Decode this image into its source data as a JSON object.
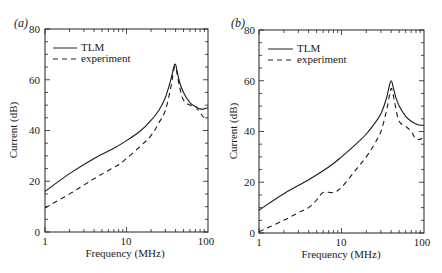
{
  "chart_data": [
    {
      "panel_label": "(a)",
      "type": "line",
      "xlabel": "Frequency (MHz)",
      "ylabel": "Current (dB)",
      "xscale": "log",
      "xlim": [
        1,
        100
      ],
      "ylim": [
        0,
        80
      ],
      "xticks": [
        "1",
        "10",
        "100"
      ],
      "yticks": [
        "0",
        "20",
        "40",
        "60",
        "80"
      ],
      "grid": false,
      "legend": {
        "position": "upper left",
        "entries": [
          "TLM",
          "experiment"
        ]
      },
      "series": [
        {
          "name": "TLM",
          "style": "solid",
          "x": [
            1,
            2,
            4,
            7,
            10,
            15,
            20,
            25,
            30,
            35,
            38,
            40,
            42,
            45,
            50,
            60,
            70,
            80,
            90,
            100
          ],
          "y": [
            16,
            23,
            29,
            33,
            36,
            40,
            44,
            48,
            53,
            60,
            65,
            66,
            63,
            59,
            55,
            51,
            49.5,
            48.5,
            48.5,
            49
          ]
        },
        {
          "name": "experiment",
          "style": "dashed",
          "x": [
            1,
            2,
            4,
            7,
            8,
            10,
            15,
            20,
            25,
            30,
            35,
            38,
            40,
            42,
            45,
            50,
            60,
            70,
            80,
            90,
            100
          ],
          "y": [
            9.5,
            15,
            21,
            25.5,
            26.5,
            29,
            34,
            38,
            43,
            48,
            57,
            64,
            65,
            62,
            57,
            52,
            50,
            49.5,
            47,
            45,
            45
          ]
        }
      ]
    },
    {
      "panel_label": "(b)",
      "type": "line",
      "xlabel": "Frequency (MHz)",
      "ylabel": "Current (dB)",
      "xscale": "log",
      "xlim": [
        1,
        100
      ],
      "ylim": [
        0,
        80
      ],
      "xticks": [
        "1",
        "10",
        "100"
      ],
      "yticks": [
        "0",
        "20",
        "40",
        "60",
        "80"
      ],
      "grid": false,
      "legend": {
        "position": "upper left",
        "entries": [
          "TLM",
          "experiment"
        ]
      },
      "series": [
        {
          "name": "TLM",
          "style": "solid",
          "x": [
            1,
            2,
            4,
            7,
            10,
            15,
            20,
            25,
            30,
            35,
            38,
            40,
            42,
            45,
            50,
            60,
            70,
            80,
            90,
            100
          ],
          "y": [
            9,
            15.5,
            21,
            26,
            30,
            35,
            39,
            43,
            47,
            53,
            58,
            60,
            58,
            54,
            50,
            46,
            44,
            43,
            42.5,
            42.5
          ]
        },
        {
          "name": "experiment",
          "style": "dashed",
          "x": [
            1,
            2,
            3,
            4,
            5,
            6,
            8,
            10,
            15,
            20,
            25,
            30,
            35,
            38,
            40,
            42,
            45,
            50,
            60,
            70,
            80,
            90,
            100
          ],
          "y": [
            0.5,
            5,
            8,
            10,
            13,
            16,
            16,
            18,
            25,
            30,
            35,
            40,
            48,
            54,
            57,
            55,
            50,
            44,
            42,
            40,
            37,
            37,
            37.5
          ]
        }
      ]
    }
  ],
  "panels": [
    {
      "label": "(a)",
      "xlabel": "Frequency (MHz)",
      "ylabel": "Current (dB)",
      "legend_tlm": "TLM",
      "legend_exp": "experiment",
      "yt0": "0",
      "yt1": "20",
      "yt2": "40",
      "yt3": "60",
      "yt4": "80",
      "xt0": "1",
      "xt1": "10",
      "xt2": "100"
    },
    {
      "label": "(b)",
      "xlabel": "Frequency (MHz)",
      "ylabel": "Current (dB)",
      "legend_tlm": "TLM",
      "legend_exp": "experiment",
      "yt0": "0",
      "yt1": "20",
      "yt2": "40",
      "yt3": "60",
      "yt4": "80",
      "xt0": "1",
      "xt1": "10",
      "xt2": "100"
    }
  ]
}
